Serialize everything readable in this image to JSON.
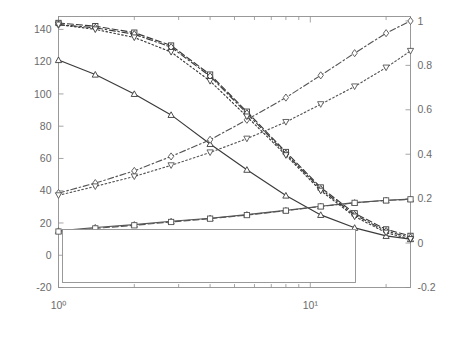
{
  "chart_data": {
    "type": "line",
    "title": "",
    "xlabel": "λ",
    "ylabel": "I(Xⁱⁿ; Yₘᴀ)",
    "ylabel_right": "Probability of Detection",
    "xscale": "log",
    "xlim": [
      1,
      25
    ],
    "ylim": [
      -20,
      148
    ],
    "ylim_right": [
      -0.2,
      1.02
    ],
    "xticks": [
      1,
      10
    ],
    "xtick_labels": [
      "10⁰",
      "10¹"
    ],
    "yticks": [
      -20,
      0,
      20,
      40,
      60,
      80,
      100,
      120,
      140
    ],
    "ytick_labels": [
      "-20",
      "0",
      "20",
      "40",
      "60",
      "80",
      "100",
      "120",
      "140"
    ],
    "yticks_right": [
      -0.2,
      0,
      0.2,
      0.4,
      0.6,
      0.8,
      1
    ],
    "ytick_labels_right": [
      "-0.2",
      "0",
      "0.2",
      "0.4",
      "0.6",
      "0.8",
      "1"
    ],
    "grid": false,
    "legend_position": "lower-left",
    "series": [
      {
        "name": "30-Bus, ρ = 0.1",
        "axis": "left",
        "marker": "triangle-up",
        "linestyle": "solid",
        "color": "#3a3a3a",
        "x": [
          1,
          1.4,
          2,
          2.8,
          4,
          5.6,
          8,
          11,
          15,
          20,
          25
        ],
        "y": [
          121,
          112,
          100,
          87,
          69,
          53,
          37,
          25,
          17,
          12,
          10
        ]
      },
      {
        "name": "30-Bus, ρ = 0.1",
        "axis": "right",
        "marker": "triangle-up",
        "linestyle": "solid",
        "color": "#555555",
        "x": [
          1,
          1.4,
          2,
          2.8,
          4,
          5.6,
          8,
          11,
          15,
          20,
          25
        ],
        "y": [
          0.055,
          0.07,
          0.083,
          0.098,
          0.112,
          0.128,
          0.147,
          0.166,
          0.182,
          0.193,
          0.198
        ]
      },
      {
        "name": "30-Bus, ρ = 0.9",
        "axis": "left",
        "marker": "square",
        "linestyle": "dashed",
        "color": "#3a3a3a",
        "x": [
          1,
          1.4,
          2,
          2.8,
          4,
          5.6,
          8,
          11,
          15,
          20,
          25
        ],
        "y": [
          144,
          142,
          138,
          130,
          112,
          89,
          64,
          42,
          26,
          16,
          12
        ]
      },
      {
        "name": "30-Bus, ρ = 0.9",
        "axis": "right",
        "marker": "square",
        "linestyle": "dashed",
        "color": "#555555",
        "x": [
          1,
          1.4,
          2,
          2.8,
          4,
          5.6,
          8,
          11,
          15,
          20,
          25
        ],
        "y": [
          0.052,
          0.066,
          0.08,
          0.095,
          0.11,
          0.126,
          0.146,
          0.165,
          0.181,
          0.192,
          0.197
        ]
      },
      {
        "name": "118-Bus, ρ = 0.1",
        "axis": "left",
        "marker": "diamond",
        "linestyle": "dashdot",
        "color": "#3a3a3a",
        "x": [
          1,
          1.4,
          2,
          2.8,
          4,
          5.6,
          8,
          11,
          15,
          20,
          25
        ],
        "y": [
          143,
          141,
          137,
          129,
          111,
          88,
          63,
          41,
          25,
          15,
          11
        ]
      },
      {
        "name": "118-Bus, ρ = 0.1",
        "axis": "right",
        "marker": "diamond",
        "linestyle": "dashdot",
        "color": "#555555",
        "x": [
          1,
          1.4,
          2,
          2.8,
          4,
          5.6,
          8,
          11,
          15,
          20,
          25
        ],
        "y": [
          0.225,
          0.27,
          0.325,
          0.39,
          0.465,
          0.555,
          0.655,
          0.755,
          0.855,
          0.945,
          1.0
        ]
      },
      {
        "name": "118-Bus, ρ = 0.9",
        "axis": "left",
        "marker": "triangle-down",
        "linestyle": "dotted",
        "color": "#3a3a3a",
        "x": [
          1,
          1.4,
          2,
          2.8,
          4,
          5.6,
          8,
          11,
          15,
          20,
          25
        ],
        "y": [
          143,
          140,
          135,
          126,
          108,
          86,
          62,
          40,
          24,
          14,
          10
        ]
      },
      {
        "name": "118-Bus, ρ = 0.9",
        "axis": "right",
        "marker": "triangle-down",
        "linestyle": "dotted",
        "color": "#555555",
        "x": [
          1,
          1.4,
          2,
          2.8,
          4,
          5.6,
          8,
          11,
          15,
          20,
          25
        ],
        "y": [
          0.215,
          0.255,
          0.3,
          0.35,
          0.408,
          0.47,
          0.545,
          0.625,
          0.705,
          0.79,
          0.865
        ]
      }
    ],
    "legend": [
      {
        "label": "30-Bus, ρ = 0.1",
        "marker": "triangle-up",
        "linestyle": "solid",
        "column": 0
      },
      {
        "label": "30-Bus, ρ = 0.1",
        "marker": "triangle-up",
        "linestyle": "solid",
        "column": 0
      },
      {
        "label": "30-Bus, ρ = 0.9",
        "marker": "square",
        "linestyle": "dashed",
        "column": 0
      },
      {
        "label": "30-Bus, ρ = 0.9",
        "marker": "square",
        "linestyle": "dashed",
        "column": 0
      },
      {
        "label": "118-Bus, ρ = 0.1",
        "marker": "diamond",
        "linestyle": "dashdot",
        "column": 1
      },
      {
        "label": "118-Bus, ρ = 0.1",
        "marker": "diamond",
        "linestyle": "dashdot",
        "column": 1
      },
      {
        "label": "118-Bus, ρ = 0.9",
        "marker": "triangle-down",
        "linestyle": "dotted",
        "column": 1
      },
      {
        "label": "118-Bus, ρ = 0.9",
        "marker": "triangle-down",
        "linestyle": "dotted",
        "column": 1
      }
    ]
  },
  "ylabel_parts": {
    "i_open": "I(",
    "x": "X",
    "x_sup": "n",
    "x_sub": "i",
    "sep": "; ",
    "y": "Y",
    "y_sup": "m",
    "y_sub": "A",
    "close": ")"
  }
}
